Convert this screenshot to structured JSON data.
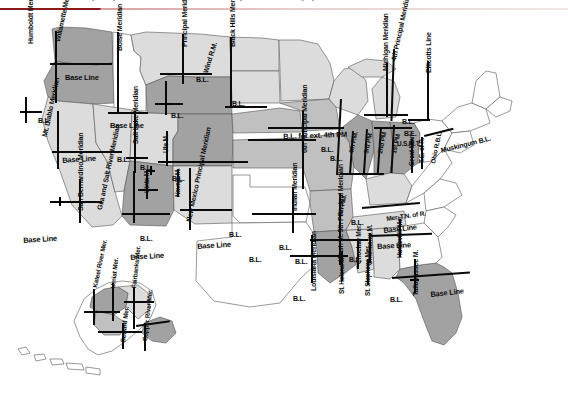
{
  "header": {
    "cropped_caption": "principal meridians and base lines of the public land survey system",
    "rule_color_dark": "#8b1a1a",
    "rule_color_light": "#e8cfcf"
  },
  "map": {
    "title": "Principal Meridians and Base Lines of the United States Public Land Survey System",
    "palette": {
      "unsurveyed_white": "#ffffff",
      "light_gray": "#d8d8d8",
      "medium_gray": "#b9b9b9",
      "dark_gray": "#9a9a9a",
      "darker_gray": "#8a8a8a",
      "outline": "#4a4a4a",
      "survey_line": "#0a0a0a",
      "label_text": "#0d0d0d"
    },
    "meridian_labels": [
      {
        "id": "humboldt",
        "text": "Humboldt Meridian",
        "x": 27,
        "y": 33,
        "rot": -90,
        "size": "sz7"
      },
      {
        "id": "willamette",
        "text": "Willamette Meridian",
        "x": 54,
        "y": 30,
        "rot": -78,
        "size": "sz7"
      },
      {
        "id": "boise",
        "text": "Boise Meridian",
        "x": 116,
        "y": 40,
        "rot": -90,
        "size": "sz7"
      },
      {
        "id": "montana-principal",
        "text": "Principal Meridian",
        "x": 181,
        "y": 36,
        "rot": -90,
        "size": "sz7"
      },
      {
        "id": "wind-river",
        "text": "Wind R.M.",
        "x": 202,
        "y": 61,
        "rot": -73,
        "size": "sz7"
      },
      {
        "id": "black-hills",
        "text": "Black Hills Meridian",
        "x": 229,
        "y": 36,
        "rot": -90,
        "size": "sz7"
      },
      {
        "id": "mt-diablo",
        "text": "Mt. Diablo Meridian",
        "x": 41,
        "y": 125,
        "rot": -78,
        "size": "sz7"
      },
      {
        "id": "salt-lake",
        "text": "Salt Lake Meridian",
        "x": 132,
        "y": 133,
        "rot": -90,
        "size": "sz7"
      },
      {
        "id": "uintah",
        "text": "Uinta M.",
        "x": 144,
        "y": 182,
        "rot": -90,
        "size": "sz65"
      },
      {
        "id": "ute",
        "text": "Ute M.",
        "x": 163,
        "y": 142,
        "rot": -90,
        "size": "sz65"
      },
      {
        "id": "navajo",
        "text": "Navajo M.",
        "x": 175,
        "y": 186,
        "rot": -90,
        "size": "sz65"
      },
      {
        "id": "san-bernardino",
        "text": "San Bernardino Meridian",
        "x": 77,
        "y": 200,
        "rot": -90,
        "size": "sz7"
      },
      {
        "id": "gila-salt",
        "text": "Gila and Salt River Meridian",
        "x": 96,
        "y": 198,
        "rot": -78,
        "size": "sz7"
      },
      {
        "id": "new-mexico",
        "text": "New Mexico Principal Meridian",
        "x": 185,
        "y": 210,
        "rot": -78,
        "size": "sz7"
      },
      {
        "id": "sixth-principal",
        "text": "6th Principal Meridian",
        "x": 301,
        "y": 142,
        "rot": -90,
        "size": "sz7"
      },
      {
        "id": "indian",
        "text": "Indian Meridian",
        "x": 291,
        "y": 200,
        "rot": -90,
        "size": "sz7"
      },
      {
        "id": "fourth-principal",
        "text": "4th Principal Meridian",
        "x": 390,
        "y": 49,
        "rot": -78,
        "size": "sz7"
      },
      {
        "id": "michigan",
        "text": "Michigan Meridian",
        "x": 382,
        "y": 60,
        "rot": -90,
        "size": "sz7"
      },
      {
        "id": "ellicotts",
        "text": "Ellicotts Line",
        "x": 425,
        "y": 62,
        "rot": -90,
        "size": "sz7"
      },
      {
        "id": "fourth-pm",
        "text": "4th P.M.",
        "x": 348,
        "y": 142,
        "rot": -78,
        "size": "sz65"
      },
      {
        "id": "third-pm",
        "text": "3rd PM",
        "x": 363,
        "y": 142,
        "rot": -78,
        "size": "sz65"
      },
      {
        "id": "second-pm",
        "text": "2nd PM",
        "x": 377,
        "y": 142,
        "rot": -78,
        "size": "sz65"
      },
      {
        "id": "first-pm",
        "text": "1st PM",
        "x": 391,
        "y": 142,
        "rot": -78,
        "size": "sz65"
      },
      {
        "id": "usmt",
        "text": "U.S.M.T.",
        "x": 397,
        "y": 130,
        "rot": 0,
        "size": "sz65"
      },
      {
        "id": "great-miami",
        "text": "Great Miami",
        "x": 409,
        "y": 155,
        "rot": -90,
        "size": "sz65"
      },
      {
        "id": "te-of-r",
        "text": "T.E. of R.",
        "x": 419,
        "y": 152,
        "rot": -90,
        "size": "sz65"
      },
      {
        "id": "ohio-rbl",
        "text": "Ohio R.B.L.",
        "x": 430,
        "y": 152,
        "rot": -78,
        "size": "sz65"
      },
      {
        "id": "muskingum",
        "text": "Muskingum B.L.",
        "x": 440,
        "y": 136,
        "rot": -14,
        "size": "sz7"
      },
      {
        "id": "mer-tn-of-r",
        "text": "Mer. T.N. of R.",
        "x": 386,
        "y": 205,
        "rot": -8,
        "size": "sz65"
      },
      {
        "id": "fifth-pm",
        "text": "5th P.M.",
        "x": 337,
        "y": 205,
        "rot": -78,
        "size": "sz65"
      },
      {
        "id": "wash-m-5th",
        "text": "Wash M. 5th Principal Meridian",
        "x": 337,
        "y": 250,
        "rot": -90,
        "size": "sz7"
      },
      {
        "id": "choctaw",
        "text": "Choctaw Mer.",
        "x": 356,
        "y": 253,
        "rot": -90,
        "size": "sz65"
      },
      {
        "id": "chickasaw",
        "text": "Chickasaw M.",
        "x": 367,
        "y": 254,
        "rot": -90,
        "size": "sz65"
      },
      {
        "id": "huntsville",
        "text": "Huntsville Mer.",
        "x": 397,
        "y": 247,
        "rot": -90,
        "size": "sz65"
      },
      {
        "id": "louisiana",
        "text": "Louisiana Meridian",
        "x": 310,
        "y": 280,
        "rot": -90,
        "size": "sz7"
      },
      {
        "id": "st-helena",
        "text": "St. Helena M.",
        "x": 339,
        "y": 283,
        "rot": -90,
        "size": "sz65"
      },
      {
        "id": "st-stephens",
        "text": "St. Stephens Mer.",
        "x": 365,
        "y": 285,
        "rot": -90,
        "size": "sz65"
      },
      {
        "id": "tallahassee",
        "text": "Tallahassee M.",
        "x": 412,
        "y": 285,
        "rot": -90,
        "size": "sz7"
      },
      {
        "id": "kateel-river",
        "text": "Kateel River Mer.",
        "x": 92,
        "y": 276,
        "rot": -78,
        "size": "sz65"
      },
      {
        "id": "umiat",
        "text": "Umiat Mer.",
        "x": 110,
        "y": 277,
        "rot": -84,
        "size": "sz65"
      },
      {
        "id": "fairbanks",
        "text": "Fairbanks Mer.",
        "x": 131,
        "y": 277,
        "rot": -84,
        "size": "sz65"
      },
      {
        "id": "seward",
        "text": "Seward Mer.",
        "x": 120,
        "y": 331,
        "rot": -84,
        "size": "sz65"
      },
      {
        "id": "copper-river",
        "text": "Copper River Mer.",
        "x": 142,
        "y": 330,
        "rot": -84,
        "size": "sz65"
      }
    ],
    "baseline_labels": [
      {
        "id": "bl-oregon",
        "text": "Base Line",
        "x": 65,
        "y": 63,
        "rot": 0,
        "size": "sz75"
      },
      {
        "id": "bl-idaho",
        "text": "Base Line",
        "x": 110,
        "y": 111,
        "rot": 0,
        "size": "sz75"
      },
      {
        "id": "bl-nevada",
        "text": "Base Line",
        "x": 62,
        "y": 146,
        "rot": -4,
        "size": "sz75"
      },
      {
        "id": "bl-california",
        "text": "Base Line",
        "x": 23,
        "y": 226,
        "rot": -4,
        "size": "sz75"
      },
      {
        "id": "bl-arizona",
        "text": "Base Line",
        "x": 130,
        "y": 243,
        "rot": -4,
        "size": "sz75"
      },
      {
        "id": "bl-newmexico",
        "text": "Base Line",
        "x": 197,
        "y": 232,
        "rot": -4,
        "size": "sz75"
      },
      {
        "id": "bl-alabama",
        "text": "Base Line",
        "x": 377,
        "y": 232,
        "rot": -3,
        "size": "sz75"
      },
      {
        "id": "bl-florida",
        "text": "Base Line",
        "x": 430,
        "y": 280,
        "rot": -6,
        "size": "sz75"
      },
      {
        "id": "bl-tennessee",
        "text": "Base Line",
        "x": 383,
        "y": 216,
        "rot": -6,
        "size": "sz75"
      },
      {
        "id": "bl-ext-4th",
        "text": "B.L. for ext. 4th PM",
        "x": 283,
        "y": 122,
        "rot": -2,
        "size": "sz75"
      }
    ],
    "bl_markers": [
      {
        "id": "bl-humboldt",
        "text": "B.L.",
        "x": 38,
        "y": 106
      },
      {
        "id": "bl-montana",
        "text": "B.L.",
        "x": 196,
        "y": 65
      },
      {
        "id": "bl-wyoming",
        "text": "B.L.",
        "x": 171,
        "y": 101
      },
      {
        "id": "bl-blackhills",
        "text": "B.L.",
        "x": 232,
        "y": 89
      },
      {
        "id": "bl-nevada2",
        "text": "B.L.",
        "x": 117,
        "y": 145
      },
      {
        "id": "bl-utah",
        "text": "B.L.",
        "x": 140,
        "y": 153
      },
      {
        "id": "bl-colorado",
        "text": "B.L.",
        "x": 172,
        "y": 164
      },
      {
        "id": "bl-newmex2",
        "text": "B.L.",
        "x": 140,
        "y": 224
      },
      {
        "id": "bl-kansas",
        "text": "B.L.",
        "x": 229,
        "y": 220
      },
      {
        "id": "bl-oklahoma",
        "text": "B.L.",
        "x": 279,
        "y": 233
      },
      {
        "id": "bl-texas",
        "text": "B.L.",
        "x": 295,
        "y": 247
      },
      {
        "id": "bl-texas2",
        "text": "B.L.",
        "x": 249,
        "y": 245
      },
      {
        "id": "bl-arkansas",
        "text": "B.L.",
        "x": 330,
        "y": 144
      },
      {
        "id": "bl-missouri",
        "text": "B.L.",
        "x": 321,
        "y": 135
      },
      {
        "id": "bl-indiana",
        "text": "B.L.",
        "x": 402,
        "y": 107
      },
      {
        "id": "bl-michigan",
        "text": "B.L.",
        "x": 404,
        "y": 119
      },
      {
        "id": "bl-illinois",
        "text": "B.L.",
        "x": 351,
        "y": 208
      },
      {
        "id": "bl-louisiana",
        "text": "B.L.",
        "x": 293,
        "y": 284
      },
      {
        "id": "bl-mississippi",
        "text": "B.L.",
        "x": 349,
        "y": 245
      },
      {
        "id": "bl-alabama2",
        "text": "B.L.",
        "x": 390,
        "y": 285
      }
    ]
  }
}
